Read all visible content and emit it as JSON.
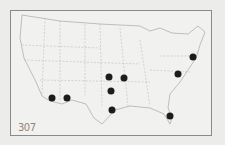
{
  "map": {
    "label": "307",
    "dot_color": "#1c1c1c",
    "points": [
      {
        "x": 52,
        "y": 98
      },
      {
        "x": 67,
        "y": 98
      },
      {
        "x": 109,
        "y": 77
      },
      {
        "x": 124,
        "y": 78
      },
      {
        "x": 111,
        "y": 91
      },
      {
        "x": 112,
        "y": 110
      },
      {
        "x": 193,
        "y": 57
      },
      {
        "x": 178,
        "y": 74
      },
      {
        "x": 170,
        "y": 116
      }
    ]
  }
}
